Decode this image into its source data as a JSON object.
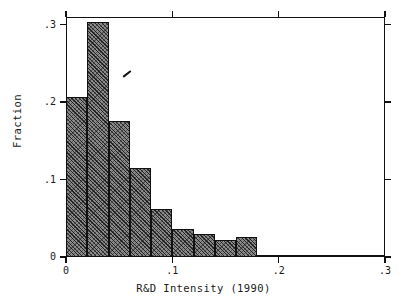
{
  "chart_data": {
    "type": "bar",
    "title": "",
    "subtitle": "",
    "xlabel": "R&D Intensity (1990)",
    "ylabel": "Fraction",
    "xlim": [
      0,
      0.3
    ],
    "ylim": [
      0,
      0.31
    ],
    "grid": false,
    "legend": null,
    "bin_width": 0.02,
    "x_ticks": [
      "0",
      ".1",
      ".2",
      ".3"
    ],
    "x_tick_values": [
      0,
      0.1,
      0.2,
      0.3
    ],
    "y_ticks": [
      "0",
      ".1",
      ".2",
      ".3"
    ],
    "y_tick_values": [
      0,
      0.1,
      0.2,
      0.3
    ],
    "categories": [
      "0.00-0.02",
      "0.02-0.04",
      "0.04-0.06",
      "0.06-0.08",
      "0.08-0.10",
      "0.10-0.12",
      "0.12-0.14",
      "0.14-0.16",
      "0.16-0.18",
      "0.18-0.20",
      "0.20-0.22",
      "0.22-0.30"
    ],
    "bin_starts": [
      0.0,
      0.02,
      0.04,
      0.06,
      0.08,
      0.1,
      0.12,
      0.14,
      0.16,
      0.18,
      0.2,
      0.22
    ],
    "bin_ends": [
      0.02,
      0.04,
      0.06,
      0.08,
      0.1,
      0.12,
      0.14,
      0.16,
      0.18,
      0.2,
      0.22,
      0.3
    ],
    "values": [
      0.207,
      0.303,
      0.176,
      0.115,
      0.062,
      0.036,
      0.03,
      0.022,
      0.026,
      0.002,
      0.002,
      0.002
    ],
    "annotations": [
      "stray scan ink mark over second bar"
    ]
  },
  "axes": {
    "y_title": "Fraction",
    "x_title": "R&D Intensity (1990)"
  },
  "colors": {
    "bar_fill": "#8a8a8a",
    "bar_edge": "#111111",
    "frame": "#111111",
    "background": "#ffffff",
    "text": "#1a1a1a"
  }
}
